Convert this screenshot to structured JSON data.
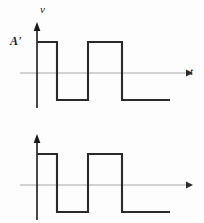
{
  "figure": {
    "background_color": "#fdfdfd",
    "wave_color": "#2a2a2a",
    "axis_color": "#a8a8a8",
    "axis_arrow_color": "#1a1a1a"
  },
  "panels": [
    {
      "id": "voltage",
      "y_axis_label": "v",
      "x_axis_label": "t",
      "amplitude_label": "A'",
      "wave_path": "M 37 42 L 57 42 L 57 100 L 88 100 L 88 42 L 122 42 L 122 100 L 170 100",
      "baseline_y": 73,
      "axis_x": 37,
      "axis_top_y": 26,
      "axis_bottom_y": 108,
      "axis_right_x": 186
    },
    {
      "id": "current",
      "y_axis_label": "i",
      "x_axis_label": "t",
      "amplitude_label": "B'",
      "wave_path": "M 37 42 L 57 42 L 57 100 L 88 100 L 88 42 L 122 42 L 122 100 L 170 100",
      "baseline_y": 73,
      "axis_x": 37,
      "axis_top_y": 26,
      "axis_bottom_y": 108,
      "axis_right_x": 186
    }
  ],
  "chart_data": [
    {
      "type": "line",
      "title": "",
      "xlabel": "t",
      "ylabel": "v",
      "annotations": [
        "A'"
      ],
      "grid": false,
      "legend": "none",
      "description": "Square wave of voltage v versus time t, starting HIGH at amplitude A', alternating between A' and a negative level symmetric about the t-axis.",
      "levels": {
        "high": "A'",
        "low": "-A'",
        "zero": 0
      },
      "x": [
        0,
        20,
        20,
        51,
        51,
        85,
        85,
        133
      ],
      "y": [
        1,
        1,
        -1,
        -1,
        1,
        1,
        -1,
        -1
      ],
      "ylim": [
        -1.6,
        1.6
      ],
      "xlim": [
        0,
        149
      ]
    },
    {
      "type": "line",
      "title": "",
      "xlabel": "t",
      "ylabel": "i",
      "annotations": [
        "B'"
      ],
      "grid": false,
      "legend": "none",
      "description": "Square wave of current i versus time t, in phase with v, starting HIGH at amplitude B', alternating between B' and a negative level symmetric about the t-axis.",
      "levels": {
        "high": "B'",
        "low": "-B'",
        "zero": 0
      },
      "x": [
        0,
        20,
        20,
        51,
        51,
        85,
        85,
        133
      ],
      "y": [
        1,
        1,
        -1,
        -1,
        1,
        1,
        -1,
        -1
      ],
      "ylim": [
        -1.6,
        1.6
      ],
      "xlim": [
        0,
        149
      ]
    }
  ]
}
